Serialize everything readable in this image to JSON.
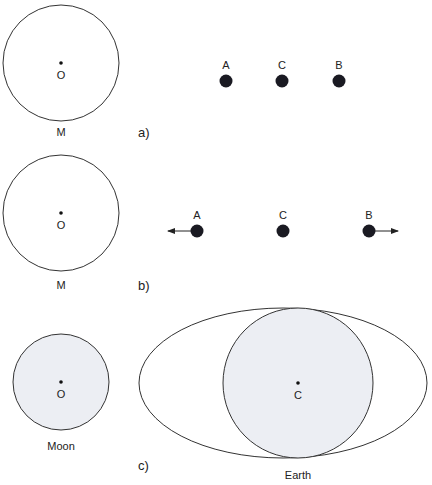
{
  "panels": {
    "a": {
      "label": "a)",
      "body_label": "M",
      "center_label": "O",
      "points": [
        {
          "name": "A",
          "x": 226
        },
        {
          "name": "C",
          "x": 282
        },
        {
          "name": "B",
          "x": 339
        }
      ]
    },
    "b": {
      "label": "b)",
      "body_label": "M",
      "center_label": "O",
      "points": [
        {
          "name": "A",
          "x": 197,
          "arrow": "left"
        },
        {
          "name": "C",
          "x": 283,
          "arrow": "none"
        },
        {
          "name": "B",
          "x": 369,
          "arrow": "right"
        }
      ]
    },
    "c": {
      "label": "c)",
      "moon_label": "Moon",
      "moon_center_label": "O",
      "earth_label": "Earth",
      "earth_center_label": "C"
    }
  },
  "colors": {
    "stroke": "#333333",
    "dot": "#1a1a22",
    "fill": "#eceef3"
  }
}
